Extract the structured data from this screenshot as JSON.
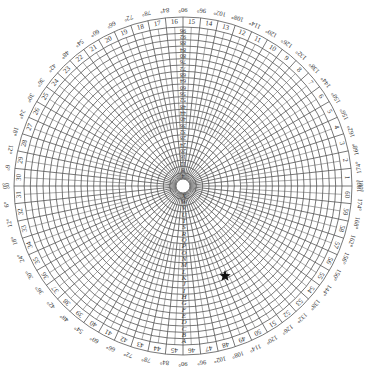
{
  "diagram": {
    "type": "polar-grid",
    "center": [
      183,
      186
    ],
    "grid_radius": 159,
    "ring_count": 24,
    "sector_count": 60,
    "sector_label_ring": [
      159,
      169
    ],
    "degree_label_radius": 177,
    "line_color": "#555555",
    "text_color": "#333333",
    "sector_numbers": {
      "start": 1,
      "end": 60,
      "note": "1 at east, increasing counter-clockwise; 16 at top, 31 at west, 46 at bottom"
    },
    "degree_labels_top": [
      "0°",
      "6°",
      "12°",
      "18°",
      "24°",
      "30°",
      "36°",
      "42°",
      "48°",
      "54°",
      "60°",
      "66°",
      "72°",
      "78°",
      "84°",
      "90°",
      "96°",
      "102°",
      "108°",
      "114°",
      "120°",
      "126°",
      "132°",
      "138°",
      "144°",
      "150°",
      "156°",
      "162°",
      "168°",
      "174°",
      "180°"
    ],
    "degree_labels_bottom": [
      "0°",
      "6°",
      "12°",
      "18°",
      "24°",
      "30°",
      "36°",
      "42°",
      "48°",
      "54°",
      "60°",
      "66°",
      "72°",
      "78°",
      "84°",
      "90°",
      "96°",
      "102°",
      "108°",
      "114°",
      "120°",
      "126°",
      "132°",
      "138°",
      "144°",
      "150°",
      "156°",
      "162°",
      "168°",
      "174°",
      "180°"
    ],
    "top_spoke_labels": [
      "4",
      "8",
      "12",
      "16",
      "20",
      "24",
      "28",
      "32",
      "36",
      "40",
      "44",
      "48",
      "52",
      "56",
      "60",
      "64",
      "68",
      "72",
      "76",
      "80",
      "84",
      "88",
      "92",
      "96"
    ],
    "bottom_spoke_labels": [
      "A",
      "B",
      "C",
      "D",
      "E",
      "F",
      "G",
      "H",
      "I",
      "J",
      "K",
      "L",
      "M",
      "N",
      "O",
      "P",
      "Q",
      "R",
      "S",
      "T",
      "U",
      "V",
      "W",
      "X"
    ],
    "marker": {
      "shape": "star",
      "position": [
        225,
        276
      ],
      "color": "#111111"
    }
  }
}
